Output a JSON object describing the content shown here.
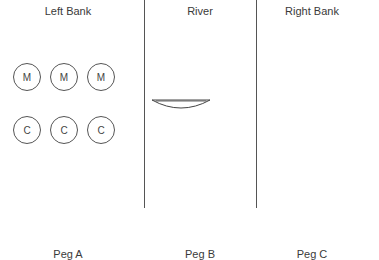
{
  "headers": {
    "left": "Left Bank",
    "river": "River",
    "right": "Right Bank"
  },
  "left_bank": {
    "missionaries": [
      "M",
      "M",
      "M"
    ],
    "cannibals": [
      "C",
      "C",
      "C"
    ]
  },
  "boat": {
    "position": "left",
    "passengers": []
  },
  "pegs": [
    "Peg A",
    "Peg B",
    "Peg C"
  ]
}
